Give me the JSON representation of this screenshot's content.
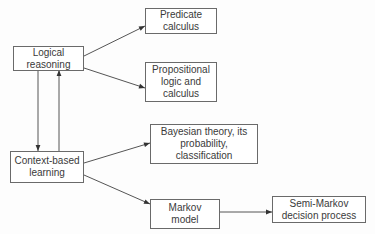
{
  "diagram": {
    "type": "flowchart",
    "colors": {
      "stroke": "#555555",
      "text": "#3a3a3a",
      "background": "#ffffff"
    },
    "nodes": [
      {
        "id": "logical",
        "label": "Logical\nreasoning"
      },
      {
        "id": "predicate",
        "label": "Predicate\ncalculus"
      },
      {
        "id": "propositional",
        "label": "Propositional\nlogic and\ncalculus"
      },
      {
        "id": "context",
        "label": "Context-based\nlearning"
      },
      {
        "id": "bayesian",
        "label": "Bayesian theory, its\nprobability,\nclassification"
      },
      {
        "id": "markov",
        "label": "Markov\nmodel"
      },
      {
        "id": "semimarkov",
        "label": "Semi-Markov\ndecision process"
      }
    ],
    "edges": [
      {
        "from": "logical",
        "to": "predicate"
      },
      {
        "from": "logical",
        "to": "propositional"
      },
      {
        "from": "logical",
        "to": "context"
      },
      {
        "from": "context",
        "to": "logical"
      },
      {
        "from": "context",
        "to": "bayesian"
      },
      {
        "from": "context",
        "to": "markov"
      },
      {
        "from": "markov",
        "to": "semimarkov"
      }
    ]
  }
}
